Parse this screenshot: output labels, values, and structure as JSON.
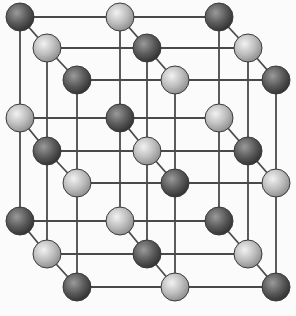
{
  "diagram": {
    "type": "crystal-lattice",
    "colors": {
      "background": "#fbfbfb",
      "bond": "#4a4a4a",
      "dark_highlight": "#9a9a9a",
      "dark_mid": "#5a5a5a",
      "dark_edge": "#2e2e2e",
      "light_highlight": "#f2f2f2",
      "light_mid": "#bdbdbd",
      "light_edge": "#8a8a8a",
      "outline": "#3a3a3a"
    },
    "radius": 14,
    "layers": [
      {
        "name": "back",
        "xs": [
          20,
          120,
          219
        ],
        "ys": [
          17,
          118,
          221
        ]
      },
      {
        "name": "middle",
        "xs": [
          47,
          147,
          248
        ],
        "ys": [
          48,
          151,
          254
        ]
      },
      {
        "name": "front",
        "xs": [
          77,
          175,
          276
        ],
        "ys": [
          80,
          183,
          287
        ]
      }
    ],
    "pattern_note": "sphere is dark when (row + col + layer) is even, light when odd"
  }
}
